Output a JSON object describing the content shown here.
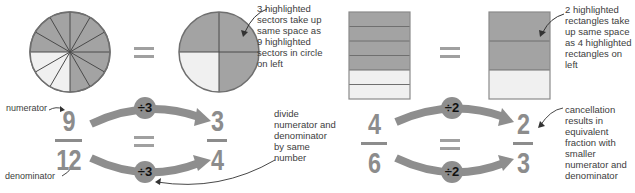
{
  "colors": {
    "shaded": "#a3a3a3",
    "unshaded": "#f0f0f0",
    "outline": "#6f6f6f",
    "arrow": "#8e8e8e",
    "numeral": "#8c8c8c",
    "text": "#3d3d3d"
  },
  "left_example": {
    "circle_left": {
      "sectors": 12,
      "highlighted": 9
    },
    "circle_right": {
      "sectors": 4,
      "highlighted": 3
    },
    "annotation_top": "3 highlighted sectors take up same space as 9 highlighted sectors in circle on left",
    "annotation_top_lines": [
      "3 highlighted",
      "sectors take up",
      "same space as",
      "9 highlighted",
      "sectors in circle",
      "on left"
    ],
    "label_numerator": "numerator",
    "label_denominator": "denominator",
    "fraction_left": {
      "numerator": "9",
      "denominator": "12"
    },
    "fraction_right": {
      "numerator": "3",
      "denominator": "4"
    },
    "operation_top": "÷3",
    "operation_bottom": "÷3",
    "annotation_bottom_lines": [
      "divide",
      "numerator and",
      "denominator",
      "by same",
      "number"
    ]
  },
  "right_example": {
    "rect_left": {
      "rows": 6,
      "highlighted": 4
    },
    "rect_right": {
      "rows": 3,
      "highlighted": 2
    },
    "annotation_top_lines": [
      "2 highlighted",
      "rectangles take",
      "up same space",
      "as 4 highlighted",
      "rectangles on",
      "left"
    ],
    "fraction_left": {
      "numerator": "4",
      "denominator": "6"
    },
    "fraction_right": {
      "numerator": "2",
      "denominator": "3"
    },
    "operation_top": "÷2",
    "operation_bottom": "÷2",
    "annotation_bottom_lines": [
      "cancellation",
      "results in",
      "equivalent",
      "fraction with",
      "smaller",
      "numerator and",
      "denominator"
    ]
  },
  "equals_sign": "="
}
